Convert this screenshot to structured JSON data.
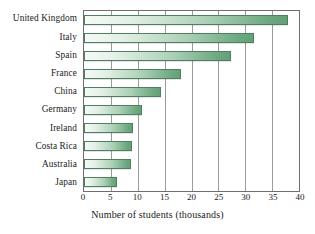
{
  "chart_data": {
    "type": "bar",
    "orientation": "horizontal",
    "title": "",
    "xlabel": "Number of students (thousands)",
    "ylabel": "",
    "xlim": [
      0,
      40
    ],
    "xticks": [
      0,
      5,
      10,
      15,
      20,
      25,
      30,
      35,
      40
    ],
    "grid": "vertical",
    "legend": "none",
    "categories": [
      "United Kingdom",
      "Italy",
      "Spain",
      "France",
      "China",
      "Germany",
      "Ireland",
      "Costa Rica",
      "Australia",
      "Japan"
    ],
    "values": [
      38.0,
      31.7,
      27.3,
      18.0,
      14.4,
      10.8,
      9.2,
      9.0,
      8.7,
      6.2
    ],
    "colors": {
      "bar_gradient_start": "#f4faf5",
      "bar_gradient_end": "#63a177",
      "bar_border": "#4f7f5f",
      "gridline": "#9a9a9a",
      "axis_frame": "#6e6e6e",
      "background": "#ffffff",
      "text": "#1a1a1a"
    }
  }
}
